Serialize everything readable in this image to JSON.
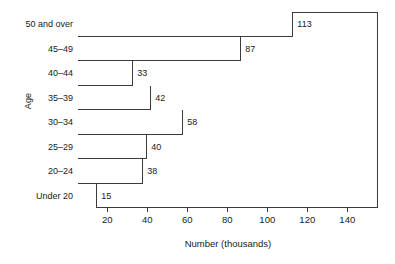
{
  "chart_data": {
    "type": "bar",
    "orientation": "horizontal",
    "title": "",
    "xlabel": "Number (thousands)",
    "ylabel": "Age",
    "categories": [
      "50 and over",
      "45–49",
      "40–44",
      "35–39",
      "30–34",
      "25–29",
      "20–24",
      "Under 20"
    ],
    "values": [
      113,
      87,
      33,
      42,
      58,
      40,
      38,
      15
    ],
    "value_labels": [
      "113",
      "87",
      "33",
      "42",
      "58",
      "40",
      "38",
      "15"
    ],
    "xticks": [
      20,
      40,
      60,
      80,
      100,
      120,
      140
    ],
    "xtick_labels": [
      "20",
      "40",
      "60",
      "80",
      "100",
      "120",
      "140"
    ],
    "xlim": [
      0,
      155
    ],
    "grid": false,
    "legend": null,
    "bar_fill": "#ffffff",
    "bar_edge": "#3b3b3b"
  }
}
